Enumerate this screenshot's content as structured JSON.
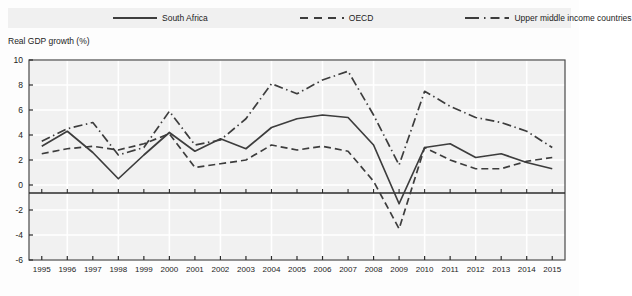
{
  "legend": {
    "items": [
      {
        "label": "South Africa",
        "style": "solid",
        "color": "#3d3d3d"
      },
      {
        "label": "OECD",
        "style": "dashed",
        "color": "#3d3d3d"
      },
      {
        "label": "Upper middle income countries",
        "style": "dashdot",
        "color": "#3d3d3d"
      }
    ]
  },
  "chart_data": {
    "type": "line",
    "title": "",
    "xlabel": "",
    "ylabel": "Real GDP growth (%)",
    "ylim": [
      -6,
      10
    ],
    "yticks": [
      10,
      8,
      6,
      4,
      2,
      0,
      -2,
      -4,
      -6
    ],
    "grid": true,
    "legend_position": "top",
    "categories": [
      "1995",
      "1996",
      "1997",
      "1998",
      "1999",
      "2000",
      "2001",
      "2002",
      "2003",
      "2004",
      "2005",
      "2006",
      "2007",
      "2008",
      "2009",
      "2010",
      "2011",
      "2012",
      "2013",
      "2014",
      "2015"
    ],
    "series": [
      {
        "name": "South Africa",
        "style": "solid",
        "values": [
          3.1,
          4.3,
          2.6,
          0.5,
          2.4,
          4.2,
          2.7,
          3.7,
          2.9,
          4.6,
          5.3,
          5.6,
          5.4,
          3.2,
          -1.5,
          3.0,
          3.3,
          2.2,
          2.5,
          1.8,
          1.3
        ]
      },
      {
        "name": "OECD",
        "style": "dashed",
        "values": [
          2.5,
          2.9,
          3.1,
          2.8,
          3.3,
          4.1,
          1.4,
          1.7,
          2.0,
          3.2,
          2.8,
          3.1,
          2.7,
          0.3,
          -3.5,
          3.0,
          2.0,
          1.3,
          1.3,
          1.9,
          2.2
        ]
      },
      {
        "name": "Upper middle income countries",
        "style": "dashdot",
        "values": [
          3.5,
          4.5,
          5.0,
          2.4,
          3.0,
          5.9,
          3.2,
          3.6,
          5.3,
          8.1,
          7.3,
          8.4,
          9.1,
          5.6,
          1.6,
          7.5,
          6.3,
          5.4,
          5.0,
          4.3,
          3.0
        ]
      }
    ]
  }
}
